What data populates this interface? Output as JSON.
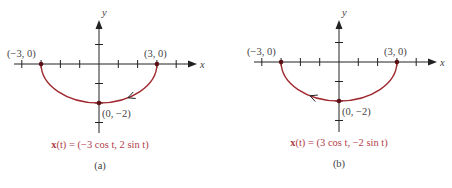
{
  "colors": {
    "curve": "#a0282e",
    "axis": "#222222",
    "formula": "#b0404a",
    "text": "#444444"
  },
  "panels": [
    {
      "id": "a",
      "caption": "(a)",
      "x_axis_label": "x",
      "y_axis_label": "y",
      "points": [
        {
          "label": "(−3, 0)",
          "x": -3,
          "y": 0
        },
        {
          "label": "(3, 0)",
          "x": 3,
          "y": 0
        },
        {
          "label": "(0, −2)",
          "x": 0,
          "y": -2
        }
      ],
      "formula": {
        "bold": "x",
        "rest": "(t) = (−3 cos t, 2 sin t)"
      },
      "direction": "counterclockwise-left-to-right",
      "arrow_at_t_deg": 240,
      "param": {
        "x_coef": -3,
        "y_coef": 2
      }
    },
    {
      "id": "b",
      "caption": "(b)",
      "x_axis_label": "x",
      "y_axis_label": "y",
      "points": [
        {
          "label": "(−3, 0)",
          "x": -3,
          "y": 0
        },
        {
          "label": "(3, 0)",
          "x": 3,
          "y": 0
        },
        {
          "label": "(0, −2)",
          "x": 0,
          "y": -2
        }
      ],
      "formula": {
        "bold": "x",
        "rest": "(t) = (3 cos t, −2 sin t)"
      },
      "direction": "right-to-left",
      "arrow_at_t_deg": 120,
      "param": {
        "x_coef": 3,
        "y_coef": -2
      }
    }
  ],
  "axis_ticks": {
    "x": [
      -4,
      -3,
      -2,
      -1,
      1,
      2,
      3,
      4
    ],
    "y": [
      1,
      -1,
      -2,
      -3
    ]
  }
}
